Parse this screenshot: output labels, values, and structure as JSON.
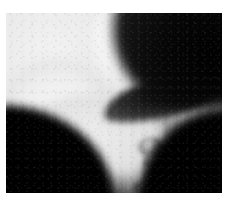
{
  "page": {
    "background_color": "#ffffff",
    "width": 231,
    "height": 212
  },
  "image_plate": {
    "kind": "grayscale-ultrasound-photograph",
    "description": "Soft grayscale ultrasound-style image showing a rounded bright mass (head/fist) against a black background with a dark wedge shadow across the middle and finger-like bright nubs along the lower-right contour.",
    "alt_text": "Grayscale ultrasound image",
    "frame": {
      "left": 6,
      "top": 13,
      "width": 216,
      "height": 180
    },
    "colors": {
      "background": "#000000",
      "highlight": "#fbfbfb",
      "midtone": "#a9a9a9",
      "shadow": "#1a1a1a",
      "page": "#ffffff"
    },
    "artifacts": {
      "vertical_banding": "present",
      "speckle_grain": "present",
      "blur": "soft"
    },
    "regions": [
      {
        "name": "main-mass",
        "tone": "bright",
        "position": "upper-left-to-center"
      },
      {
        "name": "top-lobe",
        "tone": "bright",
        "position": "top-center"
      },
      {
        "name": "left-lobe",
        "tone": "bright",
        "position": "left-center"
      },
      {
        "name": "lower-band",
        "tone": "bright",
        "position": "lower-center-left"
      },
      {
        "name": "right-lobe",
        "tone": "midtone",
        "position": "right-center"
      },
      {
        "name": "mid-wedge",
        "tone": "dark",
        "position": "center"
      },
      {
        "name": "top-right-wedge",
        "tone": "dark",
        "position": "top-right"
      },
      {
        "name": "bottom-left-fill",
        "tone": "black",
        "position": "bottom-left"
      },
      {
        "name": "bottom-right-fill",
        "tone": "black",
        "position": "bottom-right"
      },
      {
        "name": "finger-nubs",
        "tone": "bright",
        "position": "lower-right-contour"
      }
    ]
  }
}
